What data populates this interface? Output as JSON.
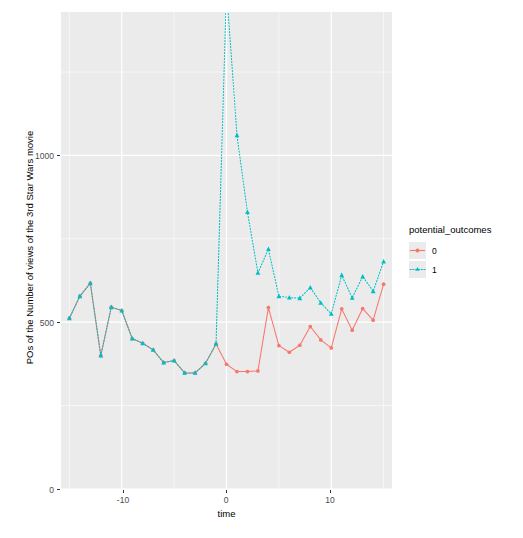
{
  "chart_data": {
    "type": "line",
    "title": "",
    "xlabel": "time",
    "ylabel": "POs of the Number of views of the 3rd Star Wars movie",
    "xlim": [
      -15.8,
      15.8
    ],
    "ylim": [
      0,
      1430
    ],
    "xticks": [
      -10,
      0,
      10
    ],
    "xticklabels": [
      "-10",
      "0",
      "10"
    ],
    "yticks": [
      0,
      500,
      1000
    ],
    "yticklabels": [
      "0",
      "500",
      "1000"
    ],
    "grid": true,
    "panel_background": "#ebebeb",
    "grid_color": "#ffffff",
    "legend": {
      "title": "potential_outcomes",
      "position": "right",
      "entries": [
        {
          "label": "0",
          "color": "#f8766d",
          "linetype": "solid",
          "marker": "circle"
        },
        {
          "label": "1",
          "color": "#00bfc4",
          "linetype": "dotted",
          "marker": "triangle"
        }
      ]
    },
    "x": [
      -15,
      -14,
      -13,
      -12,
      -11,
      -10,
      -9,
      -8,
      -7,
      -6,
      -5,
      -4,
      -3,
      -2,
      -1,
      0,
      1,
      2,
      3,
      4,
      5,
      6,
      7,
      8,
      9,
      10,
      11,
      12,
      13,
      14,
      15
    ],
    "series": [
      {
        "name": "0",
        "color": "#f8766d",
        "linetype": "solid",
        "marker": "circle",
        "values": [
          512,
          578,
          617,
          400,
          545,
          535,
          451,
          437,
          417,
          379,
          385,
          348,
          348,
          377,
          435,
          374,
          352,
          352,
          354,
          544,
          430,
          410,
          431,
          487,
          447,
          423,
          540,
          476,
          541,
          506,
          614
        ]
      },
      {
        "name": "1",
        "color": "#00bfc4",
        "linetype": "dotted",
        "marker": "triangle",
        "values": [
          512,
          578,
          617,
          400,
          545,
          535,
          451,
          437,
          417,
          379,
          385,
          348,
          348,
          377,
          435,
          1500,
          1060,
          830,
          648,
          719,
          578,
          574,
          572,
          604,
          558,
          525,
          641,
          573,
          637,
          593,
          682
        ]
      }
    ]
  }
}
